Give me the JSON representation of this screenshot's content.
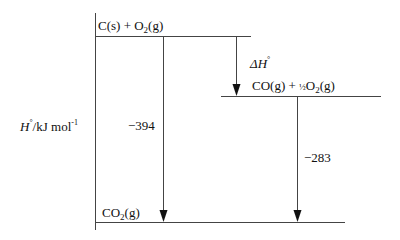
{
  "diagram": {
    "type": "enthalpy-level-diagram",
    "axis_label": {
      "symbol": "H",
      "std": "°",
      "unit": "/kJ mol",
      "exp": "-1"
    },
    "levels": [
      {
        "id": "reactants",
        "species": [
          {
            "text": "C(s) + O"
          },
          {
            "sub": "2"
          },
          {
            "text": "(g)"
          }
        ]
      },
      {
        "id": "intermediate",
        "species": [
          {
            "text": "CO(g) + "
          },
          {
            "frac": "½"
          },
          {
            "text": "O"
          },
          {
            "sub": "2"
          },
          {
            "text": "(g)"
          }
        ]
      },
      {
        "id": "product",
        "species": [
          {
            "text": "CO"
          },
          {
            "sub": "2"
          },
          {
            "text": "(g)"
          }
        ]
      }
    ],
    "arrows": [
      {
        "id": "delta-h",
        "label": "ΔH",
        "label_sup": "°"
      },
      {
        "id": "combustion-c",
        "value": "−394"
      },
      {
        "id": "combustion-co",
        "value": "−283"
      }
    ]
  },
  "text": {
    "reactants_a": "C(s) + O",
    "reactants_sub": "2",
    "reactants_b": "(g)",
    "intermediate_a": "CO(g) + ",
    "intermediate_frac": "½",
    "intermediate_b": "O",
    "intermediate_sub": "2",
    "intermediate_c": "(g)",
    "product_a": "CO",
    "product_sub": "2",
    "product_b": "(g)",
    "delta_sym": "ΔH",
    "delta_sup": "°",
    "val_394": "−394",
    "val_283": "−283",
    "axis_H": "H",
    "axis_deg": "°",
    "axis_unit": "/kJ mol",
    "axis_exp": "-1"
  }
}
